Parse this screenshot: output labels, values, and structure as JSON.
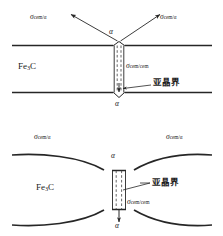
{
  "figure": {
    "type": "diagram",
    "phase_label": "Fe",
    "phase_sub": "3",
    "phase_tail": "C",
    "labels": {
      "sigma": "σ",
      "cem_alpha": "cem/α",
      "cem_cem": "cem/cem",
      "alpha": "α",
      "subgrain_boundary": "亚晶界"
    },
    "top_diagram": {
      "name": "flat-cementite-plate",
      "sigma_left": {
        "base": "σ",
        "sub": "cem/α"
      },
      "sigma_right": {
        "base": "σ",
        "sub": "cem/α"
      },
      "sigma_channel": {
        "base": "σ",
        "sub": "cem/cem"
      },
      "alpha_top": "α",
      "alpha_bottom": "α",
      "phase": "Fe3C",
      "annotation": "亚晶界"
    },
    "bottom_diagram": {
      "name": "grooved-cementite-plate",
      "sigma_left": {
        "base": "σ",
        "sub": "cem/α"
      },
      "sigma_right": {
        "base": "σ",
        "sub": "cem/α"
      },
      "sigma_channel": {
        "base": "σ",
        "sub": "cem/cem"
      },
      "alpha_top": "α",
      "alpha_bottom": "α",
      "phase": "Fe3C",
      "annotation": "亚晶界"
    },
    "colors": {
      "line": "#262626",
      "text": "#1a1a1a",
      "background": "#ffffff"
    }
  }
}
